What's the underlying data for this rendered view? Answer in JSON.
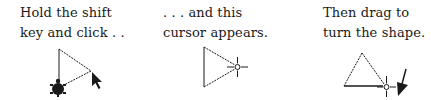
{
  "panels": [
    {
      "caption": [
        "Hold the shift",
        "key and click . ."
      ],
      "figure": "triangle-with-turtle-and-arrow-cursor"
    },
    {
      "caption": [
        ". . . and this",
        "cursor appears."
      ],
      "figure": "triangle-with-crosshair-cursor"
    },
    {
      "caption": [
        "Then drag to",
        "turn the shape."
      ],
      "figure": "rotated-triangle-with-crosshair-and-arrow"
    }
  ],
  "icons": {
    "turtle": "turtle-icon",
    "arrow_cursor": "arrow-cursor-icon",
    "crosshair_cursor": "crosshair-cursor-icon",
    "drag_arrow": "drag-direction-arrow-icon"
  },
  "colors": {
    "ink": "#1a1a1a",
    "background": "#ffffff"
  }
}
